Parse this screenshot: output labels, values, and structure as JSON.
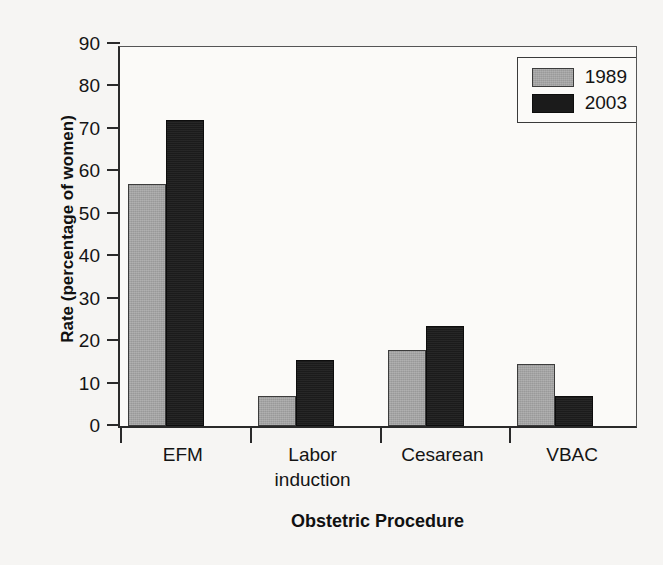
{
  "chart_data": {
    "type": "bar",
    "title": "",
    "xlabel": "Obstetric Procedure",
    "ylabel": "Rate (percentage of women)",
    "categories": [
      "EFM",
      "Labor induction",
      "Cesarean",
      "VBAC"
    ],
    "category_lines": [
      [
        "EFM"
      ],
      [
        "Labor",
        "induction"
      ],
      [
        "Cesarean"
      ],
      [
        "VBAC"
      ]
    ],
    "series": [
      {
        "name": "1989",
        "color": "#a3a3a3",
        "values": [
          57,
          7,
          18,
          14.5
        ]
      },
      {
        "name": "2003",
        "color": "#1b1b1b",
        "values": [
          72,
          15.5,
          23.5,
          7
        ]
      }
    ],
    "ylim": [
      0,
      90
    ],
    "yticks": [
      0,
      10,
      20,
      30,
      40,
      50,
      60,
      70,
      80,
      90
    ],
    "ytick_labels": [
      "0",
      "10",
      "20",
      "30",
      "40",
      "50",
      "60",
      "70",
      "80",
      "90"
    ],
    "grid": false,
    "legend_position": "top-right",
    "legend_entries": [
      "1989",
      "2003"
    ]
  },
  "axes": {
    "y_title": "Rate (percentage of women)",
    "x_title": "Obstetric Procedure"
  },
  "legend": {
    "items": [
      {
        "label": "1989",
        "swatch": "gray-swatch"
      },
      {
        "label": "2003",
        "swatch": "black-swatch"
      }
    ]
  }
}
